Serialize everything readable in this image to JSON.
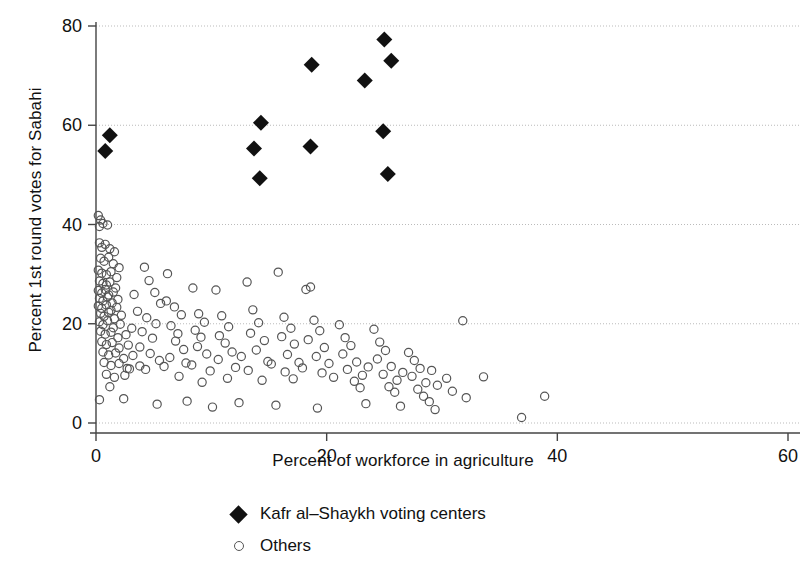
{
  "chart_data": {
    "type": "scatter",
    "title": "",
    "xlabel": "Percent of workforce in agriculture",
    "ylabel": "Percent 1st round votes for Sabahi",
    "xlim": [
      0,
      60
    ],
    "ylim": [
      0,
      80
    ],
    "xticks": [
      0,
      20,
      40,
      60
    ],
    "yticks": [
      0,
      20,
      40,
      60,
      80
    ],
    "xtick_labels": [
      "0",
      "20",
      "40",
      "60"
    ],
    "ytick_labels": [
      "0",
      "20",
      "40",
      "60",
      "80"
    ],
    "grid": "horizontal-dotted",
    "legend_position": "below-axes",
    "colors": {
      "marker_filled": "#111111",
      "marker_open_stroke": "#555555",
      "axis": "#444444",
      "grid": "#bbbbbb"
    },
    "series": [
      {
        "name": "Kafr al–Shaykh voting centers",
        "marker": "filled-diamond",
        "points": [
          [
            1.2,
            58.0
          ],
          [
            0.8,
            54.8
          ],
          [
            13.7,
            55.3
          ],
          [
            14.3,
            60.5
          ],
          [
            14.2,
            49.3
          ],
          [
            18.7,
            72.2
          ],
          [
            18.6,
            55.7
          ],
          [
            23.3,
            69.0
          ],
          [
            25.0,
            77.3
          ],
          [
            25.6,
            73.0
          ],
          [
            24.9,
            58.8
          ],
          [
            25.3,
            50.2
          ]
        ]
      },
      {
        "name": "Others",
        "marker": "open-circle",
        "points": [
          [
            0.2,
            41.8
          ],
          [
            0.4,
            40.9
          ],
          [
            0.3,
            39.6
          ],
          [
            0.6,
            40.2
          ],
          [
            1.0,
            39.9
          ],
          [
            0.3,
            36.3
          ],
          [
            0.5,
            35.4
          ],
          [
            0.8,
            36.0
          ],
          [
            1.2,
            35.1
          ],
          [
            1.6,
            34.5
          ],
          [
            0.4,
            33.2
          ],
          [
            0.7,
            32.6
          ],
          [
            1.1,
            33.4
          ],
          [
            1.5,
            32.1
          ],
          [
            2.0,
            31.3
          ],
          [
            0.2,
            30.8
          ],
          [
            0.5,
            30.2
          ],
          [
            0.9,
            29.9
          ],
          [
            1.3,
            30.5
          ],
          [
            1.8,
            29.3
          ],
          [
            0.3,
            28.6
          ],
          [
            0.6,
            28.1
          ],
          [
            0.9,
            27.8
          ],
          [
            1.2,
            28.4
          ],
          [
            1.7,
            27.2
          ],
          [
            0.2,
            26.7
          ],
          [
            0.5,
            26.2
          ],
          [
            0.8,
            26.9
          ],
          [
            1.1,
            25.8
          ],
          [
            1.5,
            26.4
          ],
          [
            0.3,
            25.1
          ],
          [
            0.6,
            24.6
          ],
          [
            1.0,
            25.4
          ],
          [
            1.4,
            24.2
          ],
          [
            1.9,
            24.9
          ],
          [
            0.2,
            23.6
          ],
          [
            0.5,
            23.1
          ],
          [
            0.9,
            23.8
          ],
          [
            1.3,
            22.7
          ],
          [
            1.8,
            23.3
          ],
          [
            0.4,
            22.1
          ],
          [
            0.7,
            21.5
          ],
          [
            1.1,
            22.3
          ],
          [
            1.6,
            21.0
          ],
          [
            2.2,
            21.7
          ],
          [
            0.3,
            20.4
          ],
          [
            0.6,
            19.8
          ],
          [
            1.0,
            20.6
          ],
          [
            1.5,
            19.2
          ],
          [
            2.1,
            19.9
          ],
          [
            0.4,
            18.5
          ],
          [
            0.8,
            17.9
          ],
          [
            1.3,
            18.3
          ],
          [
            1.9,
            17.2
          ],
          [
            2.6,
            17.8
          ],
          [
            0.5,
            16.4
          ],
          [
            0.9,
            15.8
          ],
          [
            1.4,
            16.2
          ],
          [
            2.0,
            15.1
          ],
          [
            2.8,
            15.7
          ],
          [
            0.6,
            14.3
          ],
          [
            1.1,
            13.7
          ],
          [
            1.7,
            14.1
          ],
          [
            2.4,
            13.0
          ],
          [
            3.2,
            13.6
          ],
          [
            0.7,
            12.2
          ],
          [
            1.3,
            11.6
          ],
          [
            2.0,
            12.0
          ],
          [
            2.9,
            10.9
          ],
          [
            3.8,
            11.5
          ],
          [
            0.9,
            9.8
          ],
          [
            1.6,
            9.2
          ],
          [
            2.5,
            9.6
          ],
          [
            0.3,
            4.7
          ],
          [
            1.2,
            7.3
          ],
          [
            3.3,
            25.9
          ],
          [
            4.2,
            31.4
          ],
          [
            4.6,
            28.7
          ],
          [
            5.1,
            26.3
          ],
          [
            5.6,
            24.1
          ],
          [
            3.6,
            22.5
          ],
          [
            4.4,
            21.2
          ],
          [
            5.2,
            20.0
          ],
          [
            4.0,
            18.4
          ],
          [
            4.9,
            17.1
          ],
          [
            3.8,
            15.3
          ],
          [
            4.7,
            14.0
          ],
          [
            5.5,
            12.6
          ],
          [
            4.3,
            10.8
          ],
          [
            5.9,
            11.4
          ],
          [
            6.2,
            30.1
          ],
          [
            6.8,
            23.4
          ],
          [
            7.4,
            21.8
          ],
          [
            6.5,
            19.6
          ],
          [
            7.1,
            18.0
          ],
          [
            6.9,
            16.5
          ],
          [
            7.6,
            14.8
          ],
          [
            6.4,
            13.2
          ],
          [
            7.8,
            12.1
          ],
          [
            7.2,
            9.4
          ],
          [
            8.4,
            27.2
          ],
          [
            8.9,
            22.0
          ],
          [
            9.4,
            20.3
          ],
          [
            8.6,
            18.7
          ],
          [
            9.1,
            17.3
          ],
          [
            8.8,
            15.4
          ],
          [
            9.6,
            13.9
          ],
          [
            8.3,
            11.7
          ],
          [
            9.9,
            10.5
          ],
          [
            9.2,
            8.2
          ],
          [
            10.4,
            26.8
          ],
          [
            10.9,
            21.6
          ],
          [
            11.5,
            19.4
          ],
          [
            10.7,
            17.6
          ],
          [
            11.2,
            16.1
          ],
          [
            11.8,
            14.3
          ],
          [
            10.6,
            12.8
          ],
          [
            12.1,
            11.2
          ],
          [
            11.4,
            9.0
          ],
          [
            12.6,
            13.4
          ],
          [
            13.1,
            28.4
          ],
          [
            13.6,
            22.8
          ],
          [
            14.1,
            20.2
          ],
          [
            13.4,
            18.1
          ],
          [
            14.6,
            16.6
          ],
          [
            13.9,
            14.7
          ],
          [
            14.9,
            12.4
          ],
          [
            13.2,
            10.6
          ],
          [
            15.2,
            11.9
          ],
          [
            14.4,
            8.6
          ],
          [
            15.8,
            30.4
          ],
          [
            16.3,
            21.3
          ],
          [
            16.9,
            19.1
          ],
          [
            16.1,
            17.4
          ],
          [
            17.2,
            15.9
          ],
          [
            16.6,
            13.8
          ],
          [
            17.6,
            12.2
          ],
          [
            16.4,
            10.3
          ],
          [
            17.9,
            11.1
          ],
          [
            17.1,
            8.9
          ],
          [
            18.2,
            26.9
          ],
          [
            18.6,
            27.4
          ],
          [
            18.9,
            20.7
          ],
          [
            19.4,
            18.6
          ],
          [
            18.4,
            16.8
          ],
          [
            19.8,
            15.2
          ],
          [
            19.1,
            13.4
          ],
          [
            20.2,
            12.0
          ],
          [
            19.6,
            10.1
          ],
          [
            20.6,
            9.2
          ],
          [
            21.1,
            19.8
          ],
          [
            21.6,
            17.2
          ],
          [
            22.1,
            15.6
          ],
          [
            21.4,
            13.9
          ],
          [
            22.6,
            12.3
          ],
          [
            21.8,
            10.8
          ],
          [
            23.1,
            9.6
          ],
          [
            22.4,
            8.4
          ],
          [
            23.6,
            11.3
          ],
          [
            22.9,
            7.1
          ],
          [
            24.1,
            18.9
          ],
          [
            24.6,
            16.3
          ],
          [
            25.1,
            14.6
          ],
          [
            24.4,
            12.9
          ],
          [
            25.6,
            11.4
          ],
          [
            24.9,
            9.8
          ],
          [
            26.1,
            8.6
          ],
          [
            25.4,
            7.3
          ],
          [
            26.6,
            10.2
          ],
          [
            25.9,
            6.2
          ],
          [
            27.1,
            14.2
          ],
          [
            27.6,
            12.6
          ],
          [
            28.1,
            11.0
          ],
          [
            27.4,
            9.4
          ],
          [
            28.6,
            8.1
          ],
          [
            27.9,
            6.8
          ],
          [
            29.1,
            10.6
          ],
          [
            28.4,
            5.4
          ],
          [
            29.6,
            7.6
          ],
          [
            28.9,
            4.3
          ],
          [
            31.8,
            20.6
          ],
          [
            30.4,
            9.0
          ],
          [
            30.9,
            6.4
          ],
          [
            32.1,
            5.1
          ],
          [
            33.6,
            9.3
          ],
          [
            36.9,
            1.1
          ],
          [
            38.9,
            5.4
          ],
          [
            2.4,
            4.9
          ],
          [
            5.3,
            3.8
          ],
          [
            7.9,
            4.4
          ],
          [
            10.1,
            3.2
          ],
          [
            12.4,
            4.1
          ],
          [
            15.6,
            3.6
          ],
          [
            19.2,
            3.0
          ],
          [
            23.4,
            3.9
          ],
          [
            26.4,
            3.4
          ],
          [
            29.4,
            2.7
          ],
          [
            3.1,
            19.1
          ],
          [
            6.1,
            24.6
          ],
          [
            2.7,
            11.0
          ]
        ]
      }
    ]
  },
  "legend": {
    "items": [
      {
        "label": "Kafr al–Shaykh voting centers",
        "marker": "filled-diamond"
      },
      {
        "label": "Others",
        "marker": "open-circle"
      }
    ]
  }
}
